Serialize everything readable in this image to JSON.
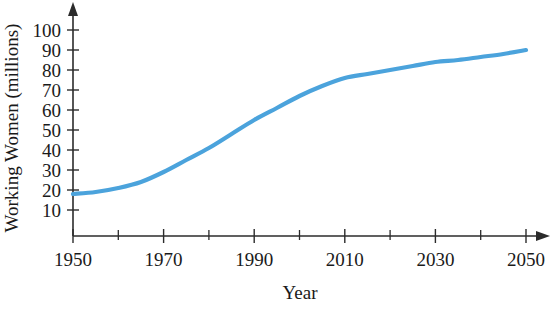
{
  "chart_data": {
    "type": "line",
    "title": "",
    "xlabel": "Year",
    "ylabel": "Working Women (millions)",
    "xlim": [
      1950,
      2050
    ],
    "ylim": [
      0,
      100
    ],
    "grid": false,
    "legend": "none",
    "line_color": "#4BA3DC",
    "axis_color": "#2b2b2b",
    "x_ticks_major": [
      1950,
      1970,
      1990,
      2010,
      2030,
      2050
    ],
    "x_ticks_minor": [
      1960,
      1980,
      2000,
      2020,
      2040
    ],
    "x_tick_labels": [
      "1950",
      "1970",
      "1990",
      "2010",
      "2030",
      "2050"
    ],
    "y_ticks": [
      10,
      20,
      30,
      40,
      50,
      60,
      70,
      80,
      90,
      100
    ],
    "y_tick_labels": [
      "10",
      "20",
      "30",
      "40",
      "50",
      "60",
      "70",
      "80",
      "90",
      "100"
    ],
    "x": [
      1950,
      1955,
      1960,
      1965,
      1970,
      1975,
      1980,
      1985,
      1990,
      1995,
      2000,
      2005,
      2010,
      2015,
      2020,
      2025,
      2030,
      2035,
      2040,
      2045,
      2050
    ],
    "values": [
      18,
      19,
      21,
      24,
      29,
      35,
      41,
      48,
      55,
      61,
      67,
      72,
      76,
      78,
      80,
      82,
      84,
      85,
      86.5,
      88,
      90
    ],
    "series": [
      {
        "name": "Working Women",
        "values": [
          18,
          19,
          21,
          24,
          29,
          35,
          41,
          48,
          55,
          61,
          67,
          72,
          76,
          78,
          80,
          82,
          84,
          85,
          86.5,
          88,
          90
        ]
      }
    ]
  }
}
